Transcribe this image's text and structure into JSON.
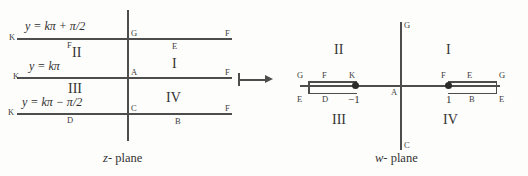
{
  "figure": {
    "ink_color": "#4d4d4d",
    "background_color": "#fdfdfb",
    "map_arrow": "maps-to-arrow"
  },
  "z_plane": {
    "caption_var": "z",
    "caption_rest": "- plane",
    "equations": [
      {
        "lhs": "y =",
        "rhs": "kπ + π/2"
      },
      {
        "lhs": "y =",
        "rhs": "kπ"
      },
      {
        "lhs": "y =",
        "rhs": "kπ − π/2"
      }
    ],
    "left_endpoint_labels": [
      "K",
      "K",
      "K"
    ],
    "under_line_labels": [
      "F",
      "",
      "D"
    ],
    "regions": [
      {
        "numeral": "II"
      },
      {
        "numeral": "III"
      }
    ],
    "right_region_numerals": [
      {
        "numeral": "I"
      },
      {
        "numeral": "IV"
      }
    ],
    "axis_labels": [
      "G",
      "A",
      "C"
    ],
    "right_endpoint_labels": [
      "F",
      "F",
      "F"
    ],
    "right_under_labels": [
      "E",
      "",
      "B"
    ]
  },
  "w_plane": {
    "caption_var": "w",
    "caption_rest": "- plane",
    "origin_label": "A",
    "top_axis_label": "G",
    "bottom_axis_label": "C",
    "quadrants": [
      {
        "numeral": "II"
      },
      {
        "numeral": "I"
      },
      {
        "numeral": "III"
      },
      {
        "numeral": "IV"
      }
    ],
    "left_branch": {
      "point_label": "−1",
      "upper_labels": [
        "G",
        "F",
        "K"
      ],
      "lower_labels": [
        "E",
        "D"
      ]
    },
    "right_branch": {
      "point_label": "1",
      "upper_labels": [
        "F",
        "E",
        "G"
      ],
      "lower_labels": [
        "1",
        "B",
        "E"
      ]
    }
  }
}
